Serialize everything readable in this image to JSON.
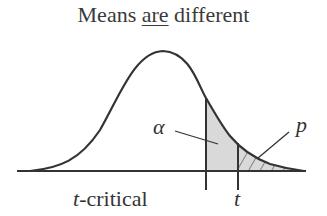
{
  "title": {
    "prefix": "Means ",
    "emphasis": "are",
    "suffix": " different"
  },
  "labels": {
    "alpha": "α",
    "p": "p",
    "t_critical_var": "t",
    "t_critical_rest": "-critical",
    "t": "t"
  },
  "colors": {
    "line": "#333333",
    "alpha_fill": "#d9d9d9",
    "p_hatch": "#444444"
  }
}
